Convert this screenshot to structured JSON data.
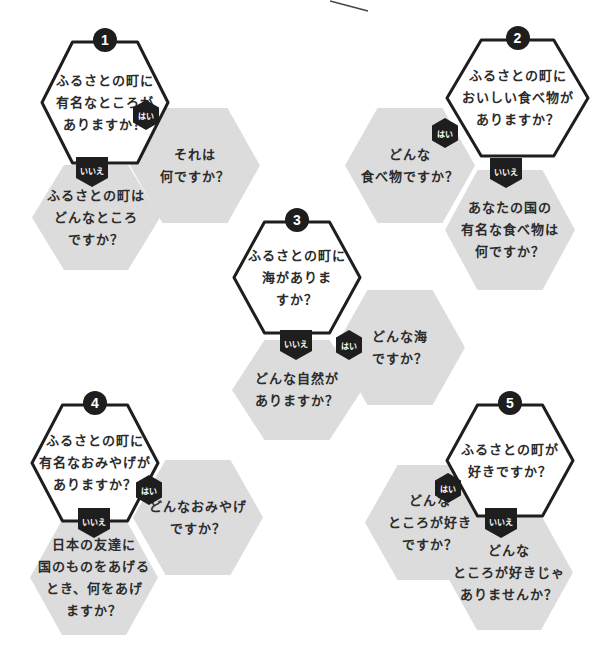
{
  "colors": {
    "outline": "#1e1e1e",
    "answer_fill": "#dcdcdc",
    "question_fill": "#ffffff",
    "badge": "#1e1e1e"
  },
  "labels": {
    "yes": "はい",
    "no": "いいえ"
  },
  "groups": [
    {
      "number": "1",
      "question": [
        "ふるさとの町に",
        "有名なところが",
        "ありますか？"
      ],
      "yes_answer": [
        "それは",
        "何ですか？"
      ],
      "no_answer": [
        "ふるさとの町は",
        "どんなところ",
        "ですか？"
      ]
    },
    {
      "number": "2",
      "question": [
        "ふるさとの町に",
        "おいしい食べ物が",
        "ありますか？"
      ],
      "yes_answer": [
        "どんな",
        "食べ物ですか？"
      ],
      "no_answer": [
        "あなたの国の",
        "有名な食べ物は",
        "何ですか？"
      ]
    },
    {
      "number": "3",
      "question": [
        "ふるさとの町に",
        "海がありま",
        "すか？"
      ],
      "yes_answer": [
        "どんな海",
        "ですか？"
      ],
      "no_answer": [
        "どんな自然が",
        "ありますか？"
      ]
    },
    {
      "number": "4",
      "question": [
        "ふるさとの町に",
        "有名なおみやげが",
        "ありますか？"
      ],
      "yes_answer": [
        "どんなおみやげ",
        "ですか？"
      ],
      "no_answer": [
        "日本の友達に",
        "国のものをあげる",
        "とき、何をあげ",
        "ますか？"
      ]
    },
    {
      "number": "5",
      "question": [
        "ふるさとの町が",
        "好きですか？"
      ],
      "yes_answer": [
        "どんな",
        "ところが好き",
        "ですか？"
      ],
      "no_answer": [
        "どんな",
        "ところが好きじゃ",
        "ありませんか？"
      ]
    }
  ]
}
